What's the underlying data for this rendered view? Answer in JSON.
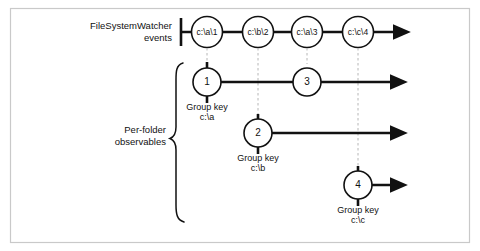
{
  "figure": {
    "colors": {
      "stroke": "#111111",
      "dashed": "#b6b6b6",
      "frame": "#c9c9c9",
      "background": "#ffffff"
    }
  },
  "labels": {
    "top_row_line1": "FileSystemWatcher",
    "top_row_line2": "events",
    "brace_line1": "Per-folder",
    "brace_line2": "observables",
    "group_key_caption": "Group key"
  },
  "source_timeline": {
    "name": "FileSystemWatcher events",
    "events": [
      {
        "label": "c:\\a\\1",
        "x": 207,
        "y": 32
      },
      {
        "label": "c:\\b\\2",
        "x": 258,
        "y": 32
      },
      {
        "label": "c:\\a\\3",
        "x": 307,
        "y": 32
      },
      {
        "label": "c:\\c\\4",
        "x": 358,
        "y": 32
      }
    ],
    "line_start_x": 181,
    "arrow_end_x": 400,
    "y": 32
  },
  "grouped_observables": [
    {
      "group_key": "c:\\a",
      "group_key_label": "Group key",
      "y": 82,
      "start_x": 185,
      "arrow_end_x": 397,
      "caption_x": 207,
      "caption_y": 104,
      "nodes": [
        {
          "label": "1",
          "x": 207,
          "y": 82
        },
        {
          "label": "3",
          "x": 307,
          "y": 82
        }
      ]
    },
    {
      "group_key": "c:\\b",
      "group_key_label": "Group key",
      "y": 133,
      "start_x": 236,
      "arrow_end_x": 397,
      "caption_x": 258,
      "caption_y": 155,
      "nodes": [
        {
          "label": "2",
          "x": 258,
          "y": 133
        }
      ]
    },
    {
      "group_key": "c:\\c",
      "group_key_label": "Group key",
      "y": 185,
      "start_x": 336,
      "arrow_end_x": 397,
      "caption_x": 358,
      "caption_y": 207,
      "nodes": [
        {
          "label": "4",
          "x": 358,
          "y": 185
        }
      ]
    }
  ]
}
